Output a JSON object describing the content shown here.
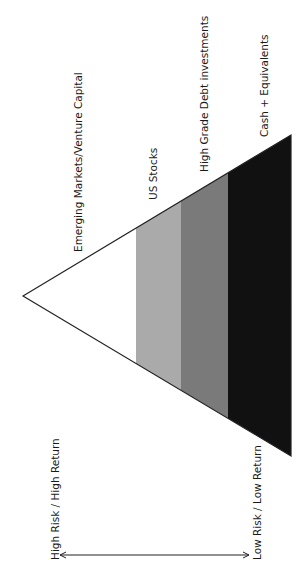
{
  "diagram": {
    "type": "risk-return-pyramid",
    "orientation": "rotated-90-ccw",
    "tiers": [
      {
        "label": "Emerging Markets/Venture Capital",
        "color": "#ffffff"
      },
      {
        "label": "US Stocks",
        "color": "#aaaaaa"
      },
      {
        "label": "High Grade Debt investments",
        "color": "#7a7a7a"
      },
      {
        "label": "Cash + Equivalents",
        "color": "#111111"
      }
    ],
    "axis": {
      "high_label": "High Risk / High Return",
      "low_label": "Low Risk / Low Return"
    },
    "outline_color": "#222222"
  }
}
